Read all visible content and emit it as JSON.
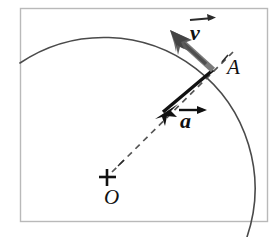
{
  "figure": {
    "type": "physics-vector-diagram",
    "background_color": "#ffffff",
    "frame_color": "#b9b9b9",
    "stroke_color": "#2b2b2b",
    "arc_color": "#4a4a4a",
    "velocity_arrow_color": "#6e6e6e",
    "acceleration_arrow_color": "#111111",
    "dashed_color": "#555555"
  },
  "labels": {
    "point_a": "A",
    "center_o": "O",
    "velocity": "v",
    "acceleration": "a"
  },
  "geometry": {
    "center": {
      "x": 107,
      "y": 177
    },
    "radius": 151,
    "point_a": {
      "x": 214,
      "y": 71
    },
    "velocity_tip": {
      "x": 171,
      "y": 31
    },
    "acceleration_tip": {
      "x": 158,
      "y": 116
    },
    "frame": {
      "x": 20,
      "y": 8,
      "width": 248,
      "height": 214
    }
  }
}
